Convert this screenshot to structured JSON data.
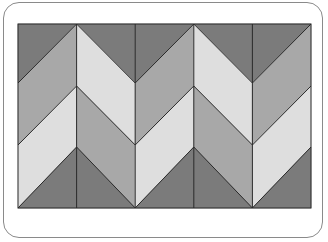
{
  "figure": {
    "title": "",
    "grid": {
      "left": 18,
      "right": 311,
      "top": 24,
      "bottom": 208,
      "columns": 5
    },
    "colors": {
      "dark": "#7b7b7b",
      "medium": "#a8a8a8",
      "light": "#dedede",
      "stroke": "#2a2a2a",
      "card_border": "#8a8a8a"
    },
    "zigzags": [
      {
        "name": "zigzag-1",
        "peak_y": 24,
        "valley_y": 83
      },
      {
        "name": "zigzag-2",
        "peak_y": 86,
        "valley_y": 145
      },
      {
        "name": "zigzag-3",
        "peak_y": 147,
        "valley_y": 208
      }
    ],
    "column_boundaries": [
      18,
      76.6,
      135.2,
      193.8,
      252.4,
      311
    ],
    "boundary_types": [
      "valley",
      "peak",
      "valley",
      "peak",
      "valley",
      "peak"
    ],
    "bands": [
      {
        "name": "top-band",
        "fill_by_column": [
          "dark",
          "dark",
          "dark",
          "dark",
          "dark"
        ]
      },
      {
        "name": "upper-middle-band",
        "fill_by_column": [
          "medium",
          "light",
          "medium",
          "light",
          "medium"
        ]
      },
      {
        "name": "lower-middle-band",
        "fill_by_column": [
          "light",
          "medium",
          "light",
          "medium",
          "light"
        ]
      },
      {
        "name": "bottom-band",
        "fill_by_column": [
          "dark",
          "dark",
          "dark",
          "dark",
          "dark"
        ]
      }
    ]
  }
}
